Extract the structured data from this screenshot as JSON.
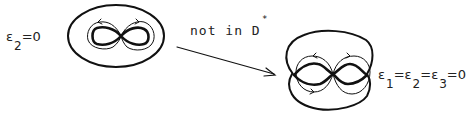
{
  "left_figure": {
    "label": {
      "symbol": "ε",
      "subscript": "2",
      "rest": "=0"
    }
  },
  "transition": {
    "text": "not in D",
    "superscript": "*"
  },
  "right_figure": {
    "label": {
      "parts": [
        {
          "symbol": "ε",
          "subscript": "1",
          "rest": "="
        },
        {
          "symbol": "ε",
          "subscript": "2",
          "rest": "="
        },
        {
          "symbol": "ε",
          "subscript": "3",
          "rest": "=0"
        }
      ]
    }
  },
  "colors": {
    "ink": "#111111",
    "background": "#ffffff"
  }
}
